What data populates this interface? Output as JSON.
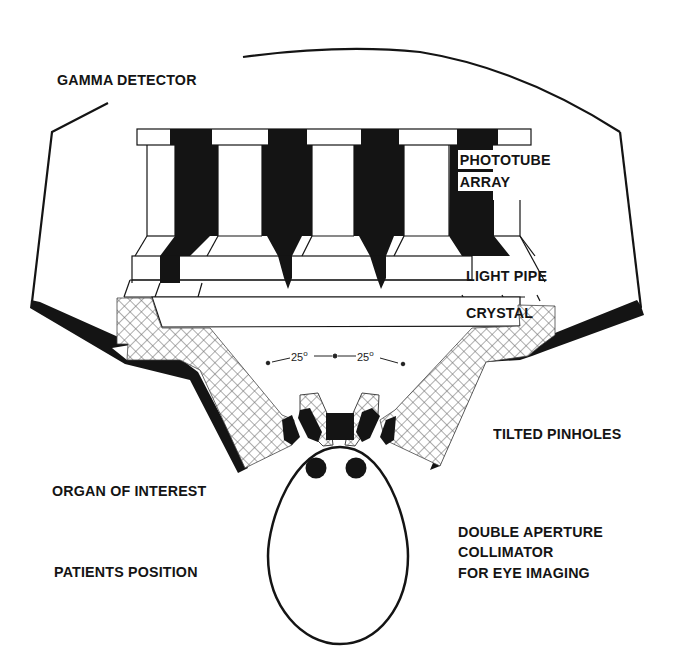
{
  "figure": {
    "colors": {
      "ink": "#141414",
      "paper": "#ffffff",
      "hatch": "#6a6a6a"
    }
  },
  "labels": {
    "gamma_detector": "GAMMA DETECTOR",
    "phototube_array_line1": "PHOTOTUBE",
    "phototube_array_line2": "ARRAY",
    "light_pipe": "LIGHT PIPE",
    "crystal": "CRYSTAL",
    "tilted_pinholes": "TILTED PINHOLES",
    "organ_of_interest": "ORGAN OF INTEREST",
    "patients_position": "PATIENTS POSITION",
    "collimator_line1": "DOUBLE APERTURE",
    "collimator_line2": "COLLIMATOR",
    "collimator_line3": "FOR EYE IMAGING"
  },
  "angles": {
    "left": "25",
    "right": "25",
    "unit": "o"
  },
  "components": [
    {
      "id": "detector-housing",
      "label": "GAMMA DETECTOR"
    },
    {
      "id": "phototube-array",
      "label": "PHOTOTUBE ARRAY",
      "tube_count": 5
    },
    {
      "id": "light-pipe",
      "label": "LIGHT PIPE"
    },
    {
      "id": "crystal",
      "label": "CRYSTAL"
    },
    {
      "id": "shielding",
      "label": ""
    },
    {
      "id": "tilted-pinholes",
      "label": "TILTED PINHOLES",
      "count": 2
    },
    {
      "id": "patient-head",
      "label": "PATIENTS POSITION"
    },
    {
      "id": "eyes",
      "label": "ORGAN OF INTEREST",
      "count": 2
    }
  ]
}
